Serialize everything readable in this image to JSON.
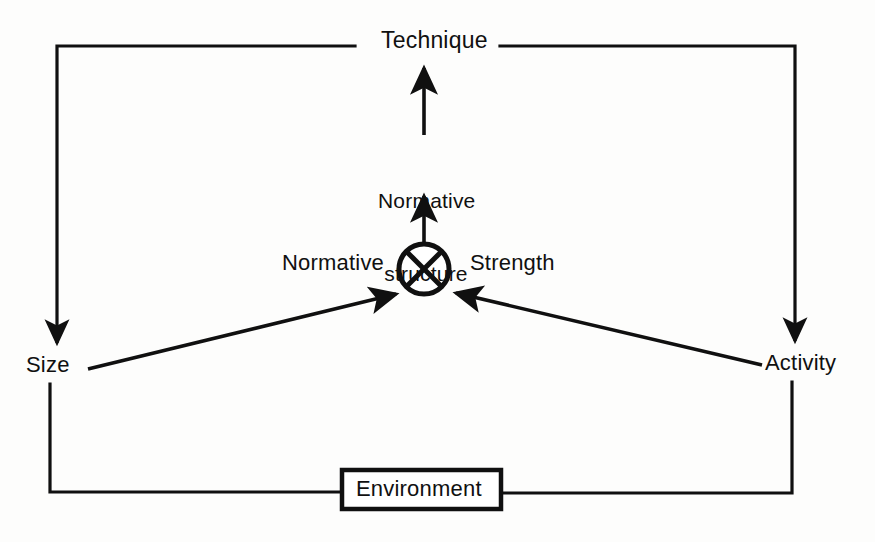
{
  "diagram": {
    "background_color": "#fdfdfc",
    "stroke_color": "#101010",
    "nodes": {
      "technique": {
        "label": "Technique",
        "shape": "text"
      },
      "normative_structure": {
        "label": "Normative\nstructure",
        "line1": "Normative",
        "line2": "structure",
        "shape": "text"
      },
      "interaction": {
        "label": "",
        "shape": "circle-with-x",
        "symbol": "multiplication-node"
      },
      "normative": {
        "label": "Normative",
        "shape": "text"
      },
      "strength": {
        "label": "Strength",
        "shape": "text"
      },
      "size": {
        "label": "Size",
        "shape": "text"
      },
      "activity": {
        "label": "Activity",
        "shape": "text"
      },
      "environment": {
        "label": "Environment",
        "shape": "rectangle"
      }
    },
    "edges": [
      {
        "from": "normative_structure",
        "to": "technique",
        "style": "arrow-up"
      },
      {
        "from": "interaction",
        "to": "normative_structure",
        "style": "arrow-up"
      },
      {
        "from": "size",
        "to": "interaction",
        "style": "arrow-diagonal-up-right"
      },
      {
        "from": "activity",
        "to": "interaction",
        "style": "arrow-diagonal-up-left"
      },
      {
        "from": "technique",
        "to": "size",
        "style": "elbow-left-arrow-down"
      },
      {
        "from": "technique",
        "to": "activity",
        "style": "elbow-right-arrow-down"
      },
      {
        "from": "size",
        "to": "environment",
        "style": "elbow-left-plain"
      },
      {
        "from": "activity",
        "to": "environment",
        "style": "elbow-right-plain"
      }
    ]
  }
}
